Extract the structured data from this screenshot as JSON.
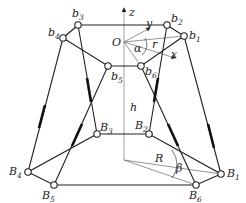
{
  "diagram": {
    "axes": {
      "z": "z",
      "x": "x",
      "y": "y",
      "origin": "O"
    },
    "parameters": {
      "upper_radius": "r",
      "lower_radius": "R",
      "height": "h",
      "upper_angle": "α",
      "lower_angle": "β"
    },
    "upper_joints": [
      {
        "base": "b",
        "idx": "1"
      },
      {
        "base": "b",
        "idx": "2"
      },
      {
        "base": "b",
        "idx": "3"
      },
      {
        "base": "b",
        "idx": "4"
      },
      {
        "base": "b",
        "idx": "5"
      },
      {
        "base": "b",
        "idx": "6"
      }
    ],
    "lower_joints": [
      {
        "base": "B",
        "idx": "1"
      },
      {
        "base": "B",
        "idx": "2"
      },
      {
        "base": "B",
        "idx": "3"
      },
      {
        "base": "B",
        "idx": "4"
      },
      {
        "base": "B",
        "idx": "5"
      },
      {
        "base": "B",
        "idx": "6"
      }
    ]
  }
}
